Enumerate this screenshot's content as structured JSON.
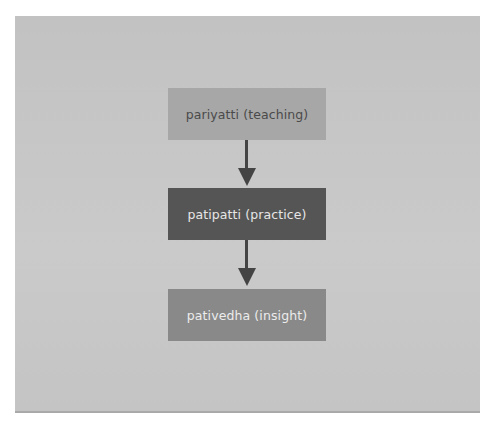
{
  "diagram": {
    "type": "flowchart",
    "direction": "top-to-bottom",
    "nodes": [
      {
        "id": "pariyatti",
        "label": "pariyatti (teaching)",
        "fill": "#a7a7a7",
        "text_color": "#4a4a4a"
      },
      {
        "id": "patipatti",
        "label": "patipatti (practice)",
        "fill": "#555555",
        "text_color": "#e6e6e6"
      },
      {
        "id": "pativedha",
        "label": "pativedha (insight)",
        "fill": "#898989",
        "text_color": "#ececec"
      }
    ],
    "edges": [
      {
        "from": "pariyatti",
        "to": "patipatti"
      },
      {
        "from": "patipatti",
        "to": "pativedha"
      }
    ],
    "colors": {
      "background_panel": "#c6c6c6",
      "arrow": "#444444"
    }
  }
}
